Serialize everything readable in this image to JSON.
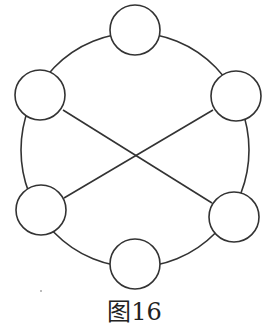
{
  "figure": {
    "caption": "图16",
    "stroke_color": "#333333",
    "outer_circle": {
      "cx": 135,
      "cy": 150,
      "rx": 114,
      "ry": 117
    },
    "nodes": [
      {
        "id": "top",
        "cx": 135,
        "cy": 30,
        "r": 25
      },
      {
        "id": "upper-left",
        "cx": 40,
        "cy": 95,
        "r": 25
      },
      {
        "id": "upper-right",
        "cx": 236,
        "cy": 96,
        "r": 25
      },
      {
        "id": "lower-left",
        "cx": 41,
        "cy": 210,
        "r": 25
      },
      {
        "id": "lower-right",
        "cx": 234,
        "cy": 217,
        "r": 25
      },
      {
        "id": "bottom",
        "cx": 135,
        "cy": 264,
        "r": 25
      }
    ],
    "cross_lines": [
      {
        "from": "upper-left",
        "to": "lower-right"
      },
      {
        "from": "upper-right",
        "to": "lower-left"
      }
    ]
  }
}
